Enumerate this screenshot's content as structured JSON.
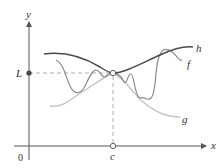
{
  "diagram": {
    "axes": {
      "x_label": "x",
      "y_label": "y",
      "origin_label": "0"
    },
    "points": {
      "limit_label": "L",
      "c_label": "c"
    },
    "curves": [
      {
        "name": "h",
        "label": "h",
        "color": "#4a4a4a",
        "role": "upper bound"
      },
      {
        "name": "f",
        "label": "f",
        "color": "#8a8a8a",
        "role": "squeezed function"
      },
      {
        "name": "g",
        "label": "g",
        "color": "#c4c4c4",
        "role": "lower bound"
      }
    ],
    "colors": {
      "axis": "#555555",
      "dashed": "#9a9a9a",
      "point_fill": "#444444",
      "background": "#ffffff"
    }
  }
}
